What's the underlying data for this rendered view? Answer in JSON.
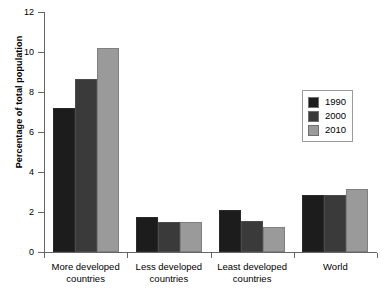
{
  "chart_data": {
    "type": "bar",
    "title": "",
    "subtitle": "",
    "xlabel": "",
    "ylabel": "Percentage of total population",
    "ylim": [
      0,
      12
    ],
    "yticks": [
      0,
      2,
      4,
      6,
      8,
      10,
      12
    ],
    "ytick_labels": [
      "0",
      "2",
      "4",
      "6",
      "8",
      "10",
      "12"
    ],
    "grid": false,
    "legend_position": "right",
    "categories": [
      "More developed countries",
      "Less developed countries",
      "Least developed countries",
      "World"
    ],
    "category_lines": [
      [
        "More developed",
        "countries"
      ],
      [
        "Less developed",
        "countries"
      ],
      [
        "Least developed",
        "countries"
      ],
      [
        "World"
      ]
    ],
    "series": [
      {
        "name": "1990",
        "color": "#1c1c1c",
        "values": [
          7.2,
          1.75,
          2.1,
          2.85
        ]
      },
      {
        "name": "2000",
        "color": "#3a3a3a",
        "values": [
          8.65,
          1.5,
          1.55,
          2.85
        ]
      },
      {
        "name": "2010",
        "color": "#9a9a9a",
        "values": [
          10.2,
          1.5,
          1.25,
          3.15
        ]
      }
    ]
  },
  "legend": {
    "entries": [
      {
        "label": "1990"
      },
      {
        "label": "2000"
      },
      {
        "label": "2010"
      }
    ]
  }
}
